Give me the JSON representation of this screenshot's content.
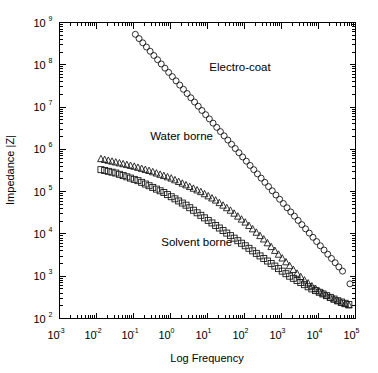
{
  "chart_data": {
    "type": "scatter",
    "title": "",
    "xlabel": "Log Frequency",
    "ylabel": "Impedance |Z|",
    "xscale": "log",
    "yscale": "log",
    "xlim": [
      -3,
      5
    ],
    "ylim": [
      2,
      9
    ],
    "grid": false,
    "legend_position": "inline-annotations",
    "x_tick_labels": [
      "10-3",
      "10-2",
      "10-1",
      "100",
      "101",
      "102",
      "103",
      "104",
      "105"
    ],
    "x_tick_mantissa": "10",
    "x_tick_exponents": [
      "-3",
      "-2",
      "-1",
      "0",
      "1",
      "2",
      "3",
      "4",
      "5"
    ],
    "y_tick_mantissa": "10",
    "y_tick_exponents": [
      "2",
      "3",
      "4",
      "5",
      "6",
      "7",
      "8",
      "9"
    ],
    "series": [
      {
        "name": "Electro-coat",
        "marker": "circle",
        "label": "Electro-coat",
        "label_x": 1.05,
        "label_y": 7.85,
        "x": [
          -0.95,
          -0.85,
          -0.75,
          -0.65,
          -0.55,
          -0.45,
          -0.35,
          -0.25,
          -0.15,
          -0.05,
          0.05,
          0.15,
          0.25,
          0.35,
          0.45,
          0.55,
          0.65,
          0.75,
          0.85,
          0.95,
          1.05,
          1.15,
          1.25,
          1.35,
          1.45,
          1.55,
          1.65,
          1.75,
          1.85,
          1.95,
          2.05,
          2.15,
          2.25,
          2.35,
          2.45,
          2.55,
          2.65,
          2.75,
          2.85,
          2.95,
          3.05,
          3.15,
          3.25,
          3.35,
          3.45,
          3.55,
          3.65,
          3.75,
          3.85,
          3.95,
          4.05,
          4.15,
          4.25,
          4.35,
          4.45,
          4.55,
          4.65,
          4.85
        ],
        "y": [
          8.72,
          8.62,
          8.52,
          8.42,
          8.32,
          8.22,
          8.12,
          8.02,
          7.92,
          7.82,
          7.72,
          7.62,
          7.52,
          7.42,
          7.32,
          7.22,
          7.12,
          7.02,
          6.92,
          6.82,
          6.72,
          6.62,
          6.52,
          6.42,
          6.32,
          6.22,
          6.12,
          6.02,
          5.92,
          5.82,
          5.72,
          5.62,
          5.52,
          5.42,
          5.32,
          5.22,
          5.12,
          5.02,
          4.92,
          4.82,
          4.72,
          4.62,
          4.52,
          4.42,
          4.32,
          4.22,
          4.12,
          4.02,
          3.92,
          3.82,
          3.72,
          3.62,
          3.52,
          3.42,
          3.32,
          3.22,
          3.12,
          2.82
        ]
      },
      {
        "name": "Water borne",
        "marker": "triangle",
        "label": "Water borne",
        "label_x": -0.55,
        "label_y": 6.22,
        "x": [
          -1.88,
          -1.78,
          -1.68,
          -1.58,
          -1.48,
          -1.38,
          -1.28,
          -1.18,
          -1.08,
          -0.98,
          -0.88,
          -0.78,
          -0.68,
          -0.58,
          -0.48,
          -0.38,
          -0.28,
          -0.18,
          -0.08,
          0.02,
          0.12,
          0.22,
          0.32,
          0.42,
          0.52,
          0.62,
          0.72,
          0.82,
          0.92,
          1.02,
          1.12,
          1.22,
          1.32,
          1.42,
          1.52,
          1.62,
          1.72,
          1.82,
          1.92,
          2.02,
          2.12,
          2.22,
          2.32,
          2.42,
          2.52,
          2.62,
          2.72,
          2.82,
          2.92,
          3.02,
          3.12,
          3.22,
          3.32,
          3.42,
          3.52,
          3.62,
          3.72,
          3.82,
          3.92,
          4.02,
          4.12,
          4.22,
          4.32,
          4.42,
          4.52,
          4.62,
          4.72,
          4.82
        ],
        "y": [
          5.78,
          5.76,
          5.74,
          5.72,
          5.7,
          5.68,
          5.66,
          5.64,
          5.62,
          5.6,
          5.575,
          5.55,
          5.525,
          5.5,
          5.47,
          5.44,
          5.41,
          5.38,
          5.35,
          5.32,
          5.28,
          5.24,
          5.2,
          5.16,
          5.12,
          5.08,
          5.04,
          5.0,
          4.95,
          4.9,
          4.85,
          4.8,
          4.74,
          4.68,
          4.62,
          4.56,
          4.49,
          4.42,
          4.35,
          4.28,
          4.2,
          4.12,
          4.04,
          3.96,
          3.88,
          3.79,
          3.7,
          3.61,
          3.52,
          3.43,
          3.34,
          3.25,
          3.16,
          3.07,
          2.99,
          2.91,
          2.84,
          2.77,
          2.71,
          2.65,
          2.6,
          2.55,
          2.5,
          2.46,
          2.42,
          2.38,
          2.35,
          2.32
        ]
      },
      {
        "name": "Solvent borne",
        "marker": "square",
        "label": "Solvent borne",
        "label_x": -0.25,
        "label_y": 3.72,
        "x": [
          -1.88,
          -1.78,
          -1.68,
          -1.58,
          -1.48,
          -1.38,
          -1.28,
          -1.18,
          -1.08,
          -0.98,
          -0.88,
          -0.78,
          -0.68,
          -0.58,
          -0.48,
          -0.38,
          -0.28,
          -0.18,
          -0.08,
          0.02,
          0.12,
          0.22,
          0.32,
          0.42,
          0.52,
          0.62,
          0.72,
          0.82,
          0.92,
          1.02,
          1.12,
          1.22,
          1.32,
          1.42,
          1.52,
          1.62,
          1.72,
          1.82,
          1.92,
          2.02,
          2.12,
          2.22,
          2.32,
          2.42,
          2.52,
          2.62,
          2.72,
          2.82,
          2.92,
          3.02,
          3.12,
          3.22,
          3.32,
          3.42,
          3.52,
          3.62,
          3.72,
          3.82,
          3.92,
          4.02,
          4.12,
          4.22,
          4.32,
          4.42,
          4.52,
          4.62,
          4.72,
          4.82
        ],
        "y": [
          5.52,
          5.5,
          5.48,
          5.46,
          5.44,
          5.41,
          5.38,
          5.35,
          5.32,
          5.29,
          5.26,
          5.22,
          5.18,
          5.14,
          5.1,
          5.06,
          5.02,
          4.98,
          4.93,
          4.88,
          4.83,
          4.78,
          4.73,
          4.68,
          4.62,
          4.56,
          4.5,
          4.44,
          4.38,
          4.32,
          4.26,
          4.2,
          4.14,
          4.08,
          4.02,
          3.96,
          3.9,
          3.84,
          3.78,
          3.72,
          3.66,
          3.6,
          3.54,
          3.48,
          3.42,
          3.36,
          3.3,
          3.24,
          3.18,
          3.12,
          3.06,
          3.0,
          2.95,
          2.9,
          2.85,
          2.8,
          2.75,
          2.7,
          2.66,
          2.62,
          2.58,
          2.54,
          2.5,
          2.46,
          2.42,
          2.39,
          2.36,
          2.33
        ]
      }
    ]
  }
}
